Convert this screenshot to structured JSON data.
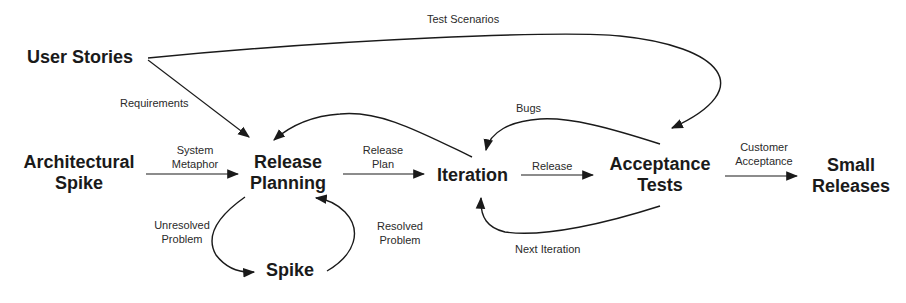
{
  "diagram": {
    "nodes": {
      "user_stories": "User Stories",
      "architectural_spike": "Architectural Spike",
      "release_planning": "Release Planning",
      "spike": "Spike",
      "iteration": "Iteration",
      "acceptance_tests": "Acceptance Tests",
      "small_releases": "Small Releases"
    },
    "node_lines": {
      "architectural_spike": [
        "Architectural",
        "Spike"
      ],
      "release_planning": [
        "Release",
        "Planning"
      ],
      "acceptance_tests": [
        "Acceptance",
        "Tests"
      ],
      "small_releases": [
        "Small",
        "Releases"
      ]
    },
    "edges": [
      {
        "from": "User Stories",
        "to": "Acceptance Tests",
        "label": "Test Scenarios"
      },
      {
        "from": "User Stories",
        "to": "Release Planning",
        "label": "Requirements"
      },
      {
        "from": "Architectural Spike",
        "to": "Release Planning",
        "label": "System Metaphor"
      },
      {
        "from": "Release Planning",
        "to": "Iteration",
        "label": "Release Plan"
      },
      {
        "from": "Iteration",
        "to": "Release Planning",
        "label": ""
      },
      {
        "from": "Release Planning",
        "to": "Spike",
        "label": "Unresolved Problem"
      },
      {
        "from": "Spike",
        "to": "Release Planning",
        "label": "Resolved Problem"
      },
      {
        "from": "Iteration",
        "to": "Acceptance Tests",
        "label": "Release"
      },
      {
        "from": "Acceptance Tests",
        "to": "Iteration",
        "label": "Bugs"
      },
      {
        "from": "Acceptance Tests",
        "to": "Iteration",
        "label": "Next Iteration"
      },
      {
        "from": "Acceptance Tests",
        "to": "Small Releases",
        "label": "Customer Acceptance"
      }
    ],
    "edge_label_lines": {
      "test_scenarios": "Test Scenarios",
      "requirements": "Requirements",
      "system_metaphor": [
        "System",
        "Metaphor"
      ],
      "release_plan": [
        "Release",
        "Plan"
      ],
      "unresolved_problem": [
        "Unresolved",
        "Problem"
      ],
      "resolved_problem": [
        "Resolved",
        "Problem"
      ],
      "release": "Release",
      "bugs": "Bugs",
      "next_iteration": "Next Iteration",
      "customer_acceptance": [
        "Customer",
        "Acceptance"
      ]
    }
  }
}
